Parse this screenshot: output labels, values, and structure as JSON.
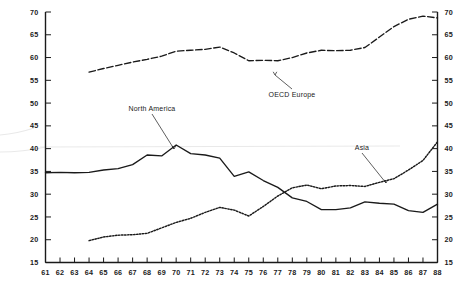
{
  "chart_data": {
    "type": "line",
    "title": "",
    "subtitle": "",
    "xlabel": "",
    "ylabel": "",
    "xlim": [
      61,
      88
    ],
    "ylim": [
      15,
      70
    ],
    "grid": false,
    "legend_position": "inline-annotations",
    "x_tick_labels": [
      "61",
      "62",
      "63",
      "64",
      "65",
      "66",
      "67",
      "68",
      "69",
      "70",
      "71",
      "72",
      "73",
      "74",
      "75",
      "76",
      "77",
      "78",
      "79",
      "80",
      "81",
      "82",
      "83",
      "84",
      "85",
      "86",
      "87",
      "88"
    ],
    "y_tick_labels": [
      "15",
      "20",
      "25",
      "30",
      "35",
      "40",
      "45",
      "50",
      "55",
      "60",
      "65",
      "70"
    ],
    "y_axis_left_labels": [
      "70",
      "65",
      "60",
      "55",
      "50",
      "45",
      "40",
      "35",
      "30",
      "25",
      "20",
      "15"
    ],
    "y_axis_right_labels": [
      "70",
      "65",
      "60",
      "55",
      "50",
      "45",
      "40",
      "35",
      "30",
      "25",
      "20",
      "15"
    ],
    "x": [
      61,
      62,
      63,
      64,
      65,
      66,
      67,
      68,
      69,
      70,
      71,
      72,
      73,
      74,
      75,
      76,
      77,
      78,
      79,
      80,
      81,
      82,
      83,
      84,
      85,
      86,
      87,
      88
    ],
    "series": [
      {
        "name": "OECD Europe",
        "label": "OECD Europe",
        "style": "dashed",
        "color": "#1a1a1a",
        "x": [
          64,
          65,
          66,
          67,
          68,
          69,
          70,
          71,
          72,
          73,
          74,
          75,
          76,
          77,
          78,
          79,
          80,
          81,
          82,
          83,
          84,
          85,
          86,
          87,
          88
        ],
        "values": [
          56.8,
          57.6,
          58.3,
          59.0,
          59.6,
          60.3,
          61.4,
          61.6,
          61.8,
          62.3,
          61.0,
          59.3,
          59.4,
          59.3,
          60.0,
          61.0,
          61.6,
          61.5,
          61.6,
          62.2,
          64.5,
          66.8,
          68.4,
          69.1,
          68.7
        ]
      },
      {
        "name": "North America",
        "label": "North America",
        "style": "solid",
        "color": "#1a1a1a",
        "x": [
          61,
          62,
          63,
          64,
          65,
          66,
          67,
          68,
          69,
          70,
          71,
          72,
          73,
          74,
          75,
          76,
          77,
          78,
          79,
          80,
          81,
          82,
          83,
          84,
          85,
          86,
          87,
          88
        ],
        "values": [
          34.7,
          34.8,
          34.7,
          34.8,
          35.3,
          35.6,
          36.5,
          38.6,
          38.4,
          40.8,
          38.9,
          38.6,
          37.9,
          33.9,
          34.9,
          33.0,
          31.5,
          29.2,
          28.4,
          26.6,
          26.6,
          27.0,
          28.3,
          28.0,
          27.8,
          26.4,
          26.0,
          27.8
        ]
      },
      {
        "name": "Asia",
        "label": "Asia",
        "style": "dotted",
        "color": "#1a1a1a",
        "x": [
          64,
          65,
          66,
          67,
          68,
          69,
          70,
          71,
          72,
          73,
          74,
          75,
          76,
          77,
          78,
          79,
          80,
          81,
          82,
          83,
          84,
          85,
          86,
          87,
          88
        ],
        "values": [
          19.8,
          20.6,
          21.0,
          21.1,
          21.4,
          22.6,
          23.8,
          24.7,
          26.0,
          27.1,
          26.5,
          25.2,
          27.3,
          29.6,
          31.4,
          32.0,
          31.2,
          31.8,
          31.9,
          31.7,
          32.6,
          33.4,
          35.3,
          37.4,
          41.5
        ]
      }
    ],
    "annotations": [
      {
        "name": "OECD Europe",
        "text": "OECD Europe",
        "text_x": 292,
        "text_y": 97,
        "point_x": 275,
        "point_y": 75
      },
      {
        "name": "North America",
        "text": "North America",
        "text_x": 152,
        "text_y": 111,
        "point_x": 174,
        "point_y": 149
      },
      {
        "name": "Asia",
        "text": "Asia",
        "text_x": 362,
        "text_y": 150,
        "point_x": 386,
        "point_y": 183
      }
    ]
  }
}
